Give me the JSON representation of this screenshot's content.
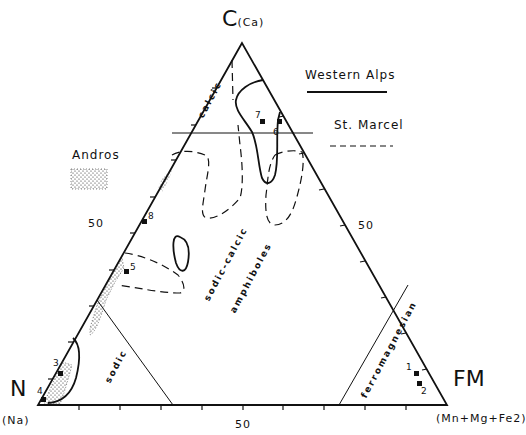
{
  "diagram": {
    "type": "ternary",
    "vertices": {
      "top": {
        "label": "C",
        "sub": "(Ca)"
      },
      "left": {
        "label": "N",
        "sub": "(Na)"
      },
      "right": {
        "label": "FM",
        "sub": "(Mn+Mg+Fe2)"
      }
    },
    "tick_labels": {
      "left_edge": "50",
      "right_edge": "50",
      "bottom_edge": "50"
    },
    "fields": {
      "calcic": "calcic",
      "sodic_calcic": "sodic-calcic",
      "amphiboles": "amphiboles",
      "sodic": "sodic",
      "ferromagnesian": "ferromagnesian"
    },
    "legend": {
      "western_alps": {
        "label": "Western Alps",
        "style": "solid"
      },
      "st_marcel": {
        "label": "St. Marcel",
        "style": "dashed"
      },
      "andros": {
        "label": "Andros",
        "style": "stippled"
      }
    },
    "points": [
      {
        "id": "1",
        "label": "1"
      },
      {
        "id": "2",
        "label": "2"
      },
      {
        "id": "3",
        "label": "3"
      },
      {
        "id": "4",
        "label": "4"
      },
      {
        "id": "5",
        "label": "5"
      },
      {
        "id": "6",
        "label": "6"
      },
      {
        "id": "7",
        "label": "7"
      },
      {
        "id": "8",
        "label": "8"
      }
    ]
  }
}
